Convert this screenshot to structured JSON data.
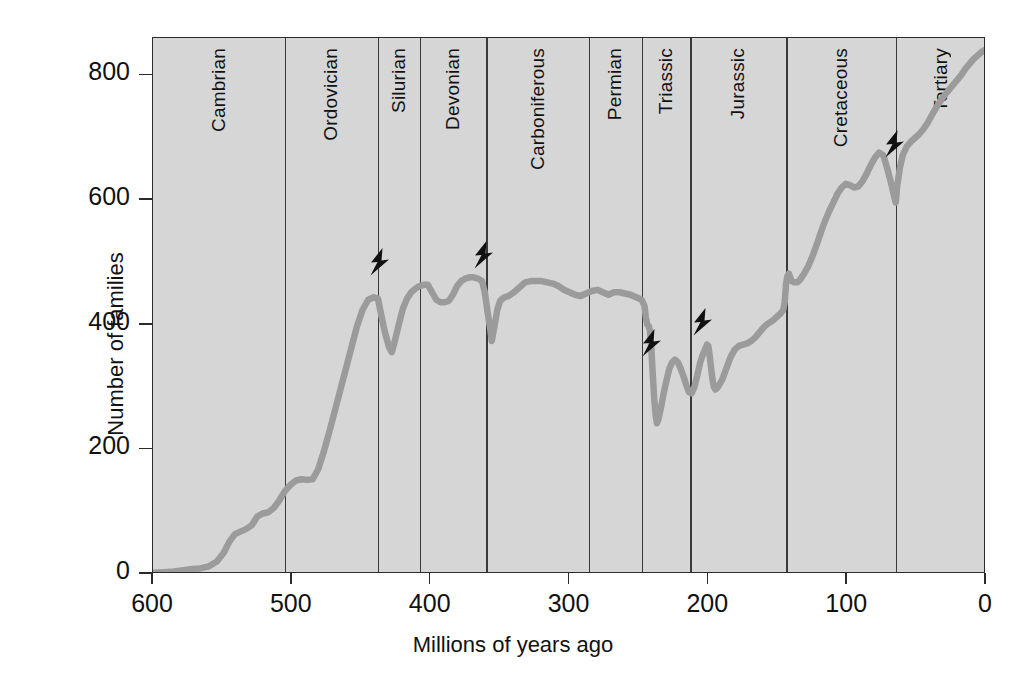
{
  "chart_data": {
    "type": "line",
    "title": "",
    "xlabel": "Millions of years ago",
    "ylabel": "Number of families",
    "xlim": [
      600,
      0
    ],
    "ylim": [
      0,
      860
    ],
    "x_ticks": [
      600,
      500,
      400,
      300,
      200,
      100,
      0
    ],
    "y_ticks": [
      0,
      200,
      400,
      600,
      800
    ],
    "x_axis_reversed": true,
    "grid": false,
    "legend": "none",
    "plot_background": "#d6d6d6",
    "line_color": "#9b9b9b",
    "axis_color": "#2b2b2b",
    "series": [
      {
        "name": "Number of marine animal families",
        "points": [
          [
            600,
            2
          ],
          [
            592,
            3
          ],
          [
            585,
            4
          ],
          [
            578,
            6
          ],
          [
            572,
            8
          ],
          [
            566,
            9
          ],
          [
            560,
            12
          ],
          [
            554,
            20
          ],
          [
            549,
            34
          ],
          [
            545,
            52
          ],
          [
            541,
            64
          ],
          [
            537,
            68
          ],
          [
            533,
            72
          ],
          [
            529,
            78
          ],
          [
            525,
            92
          ],
          [
            521,
            97
          ],
          [
            517,
            99
          ],
          [
            513,
            106
          ],
          [
            509,
            118
          ],
          [
            505,
            133
          ],
          [
            501,
            143
          ],
          [
            497,
            150
          ],
          [
            493,
            152
          ],
          [
            489,
            151
          ],
          [
            485,
            152
          ],
          [
            481,
            168
          ],
          [
            477,
            196
          ],
          [
            473,
            228
          ],
          [
            469,
            262
          ],
          [
            465,
            296
          ],
          [
            461,
            330
          ],
          [
            457,
            364
          ],
          [
            453,
            398
          ],
          [
            449,
            424
          ],
          [
            445,
            440
          ],
          [
            441,
            444
          ],
          [
            438,
            442
          ],
          [
            436,
            420
          ],
          [
            434,
            398
          ],
          [
            432,
            380
          ],
          [
            430,
            364
          ],
          [
            428,
            356
          ],
          [
            426,
            372
          ],
          [
            423,
            400
          ],
          [
            420,
            426
          ],
          [
            417,
            442
          ],
          [
            414,
            452
          ],
          [
            411,
            458
          ],
          [
            408,
            462
          ],
          [
            405,
            464
          ],
          [
            402,
            464
          ],
          [
            399,
            452
          ],
          [
            396,
            440
          ],
          [
            393,
            436
          ],
          [
            390,
            436
          ],
          [
            387,
            438
          ],
          [
            384,
            448
          ],
          [
            381,
            462
          ],
          [
            378,
            470
          ],
          [
            375,
            474
          ],
          [
            372,
            476
          ],
          [
            369,
            476
          ],
          [
            366,
            474
          ],
          [
            363,
            470
          ],
          [
            361,
            452
          ],
          [
            359,
            420
          ],
          [
            357,
            392
          ],
          [
            356,
            374
          ],
          [
            354,
            398
          ],
          [
            352,
            424
          ],
          [
            350,
            438
          ],
          [
            347,
            444
          ],
          [
            344,
            446
          ],
          [
            340,
            452
          ],
          [
            336,
            460
          ],
          [
            332,
            468
          ],
          [
            328,
            470
          ],
          [
            324,
            470
          ],
          [
            320,
            470
          ],
          [
            316,
            468
          ],
          [
            312,
            466
          ],
          [
            308,
            462
          ],
          [
            304,
            456
          ],
          [
            300,
            452
          ],
          [
            296,
            448
          ],
          [
            292,
            446
          ],
          [
            288,
            450
          ],
          [
            284,
            454
          ],
          [
            280,
            456
          ],
          [
            276,
            452
          ],
          [
            272,
            448
          ],
          [
            268,
            452
          ],
          [
            264,
            452
          ],
          [
            260,
            450
          ],
          [
            256,
            448
          ],
          [
            252,
            444
          ],
          [
            248,
            440
          ],
          [
            246,
            430
          ],
          [
            245,
            412
          ],
          [
            244,
            400
          ],
          [
            243,
            398
          ],
          [
            242,
            390
          ],
          [
            241,
            360
          ],
          [
            240,
            320
          ],
          [
            239,
            282
          ],
          [
            238,
            256
          ],
          [
            237,
            242
          ],
          [
            236,
            248
          ],
          [
            234,
            268
          ],
          [
            232,
            292
          ],
          [
            230,
            312
          ],
          [
            228,
            330
          ],
          [
            226,
            340
          ],
          [
            224,
            344
          ],
          [
            222,
            340
          ],
          [
            220,
            330
          ],
          [
            218,
            318
          ],
          [
            216,
            304
          ],
          [
            214,
            292
          ],
          [
            212,
            290
          ],
          [
            210,
            300
          ],
          [
            208,
            318
          ],
          [
            206,
            338
          ],
          [
            204,
            352
          ],
          [
            202,
            362
          ],
          [
            201,
            368
          ],
          [
            200,
            366
          ],
          [
            199,
            350
          ],
          [
            198,
            330
          ],
          [
            197,
            312
          ],
          [
            196,
            300
          ],
          [
            195,
            296
          ],
          [
            193,
            300
          ],
          [
            190,
            312
          ],
          [
            187,
            330
          ],
          [
            184,
            348
          ],
          [
            181,
            360
          ],
          [
            178,
            366
          ],
          [
            175,
            368
          ],
          [
            172,
            370
          ],
          [
            169,
            374
          ],
          [
            166,
            380
          ],
          [
            163,
            388
          ],
          [
            160,
            396
          ],
          [
            157,
            402
          ],
          [
            154,
            406
          ],
          [
            151,
            412
          ],
          [
            148,
            418
          ],
          [
            146,
            424
          ],
          [
            145,
            436
          ],
          [
            144,
            466
          ],
          [
            143,
            478
          ],
          [
            142,
            482
          ],
          [
            141,
            476
          ],
          [
            140,
            470
          ],
          [
            138,
            468
          ],
          [
            136,
            468
          ],
          [
            134,
            472
          ],
          [
            131,
            482
          ],
          [
            128,
            494
          ],
          [
            125,
            510
          ],
          [
            122,
            528
          ],
          [
            119,
            548
          ],
          [
            116,
            566
          ],
          [
            113,
            582
          ],
          [
            110,
            596
          ],
          [
            107,
            610
          ],
          [
            104,
            620
          ],
          [
            101,
            626
          ],
          [
            98,
            624
          ],
          [
            95,
            620
          ],
          [
            92,
            622
          ],
          [
            89,
            630
          ],
          [
            86,
            642
          ],
          [
            83,
            656
          ],
          [
            80,
            668
          ],
          [
            77,
            676
          ],
          [
            74,
            672
          ],
          [
            71,
            650
          ],
          [
            68,
            624
          ],
          [
            66,
            604
          ],
          [
            65,
            596
          ],
          [
            64,
            622
          ],
          [
            62,
            652
          ],
          [
            60,
            672
          ],
          [
            57,
            686
          ],
          [
            54,
            694
          ],
          [
            51,
            700
          ],
          [
            48,
            706
          ],
          [
            45,
            714
          ],
          [
            42,
            724
          ],
          [
            39,
            736
          ],
          [
            36,
            748
          ],
          [
            33,
            758
          ],
          [
            30,
            768
          ],
          [
            27,
            776
          ],
          [
            24,
            784
          ],
          [
            21,
            792
          ],
          [
            18,
            800
          ],
          [
            15,
            810
          ],
          [
            12,
            818
          ],
          [
            9,
            826
          ],
          [
            6,
            832
          ],
          [
            3,
            838
          ],
          [
            0,
            842
          ]
        ]
      }
    ],
    "periods": [
      {
        "name": "Cambrian",
        "start": 600,
        "end": 505
      },
      {
        "name": "Ordovician",
        "start": 505,
        "end": 438
      },
      {
        "name": "Silurian",
        "start": 438,
        "end": 408
      },
      {
        "name": "Devonian",
        "start": 408,
        "end": 360
      },
      {
        "name": "Carboniferous",
        "start": 360,
        "end": 286
      },
      {
        "name": "Permian",
        "start": 286,
        "end": 248
      },
      {
        "name": "Triassic",
        "start": 248,
        "end": 213
      },
      {
        "name": "Jurassic",
        "start": 213,
        "end": 144
      },
      {
        "name": "Cretaceous",
        "start": 144,
        "end": 65
      },
      {
        "name": "Tertiary",
        "start": 65,
        "end": 0
      }
    ],
    "extinction_markers": [
      {
        "label": "end-Ordovician extinction",
        "x": 438,
        "y": 500
      },
      {
        "label": "late-Devonian extinction",
        "x": 363,
        "y": 512
      },
      {
        "label": "end-Permian extinction",
        "x": 242,
        "y": 370
      },
      {
        "label": "end-Triassic extinction",
        "x": 205,
        "y": 405
      },
      {
        "label": "end-Cretaceous extinction",
        "x": 67,
        "y": 690
      }
    ]
  }
}
